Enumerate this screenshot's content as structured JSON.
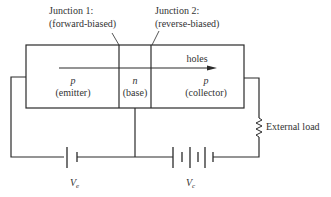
{
  "diagram": {
    "type": "pnp-transistor-circuit",
    "junction1": {
      "line1": "Junction 1:",
      "line2": "(forward-biased)"
    },
    "junction2": {
      "line1": "Junction 2:",
      "line2": "(reverse-biased)"
    },
    "regions": [
      {
        "type": "p",
        "role": "(emitter)"
      },
      {
        "type": "n",
        "role": "(base)"
      },
      {
        "type": "p",
        "role": "(collector)"
      }
    ],
    "arrow_label": "holes",
    "load_label": "External load",
    "emitter_source": {
      "symbol": "V",
      "subscript": "e"
    },
    "collector_source": {
      "symbol": "V",
      "subscript": "c"
    },
    "colors": {
      "line": "#2a2a2a",
      "text": "#333333"
    }
  }
}
